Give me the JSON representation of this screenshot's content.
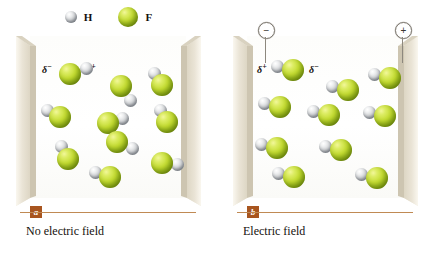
{
  "figure": {
    "legend": {
      "items": [
        {
          "symbol": "H",
          "atom": "hydrogen",
          "color": "#c9cdd1",
          "radius": 6
        },
        {
          "symbol": "F",
          "atom": "fluorine",
          "color": "#c4dc32",
          "radius": 10
        }
      ]
    },
    "colors": {
      "fluorine": "#c4dc32",
      "hydrogen": "#c9cdd1",
      "plate": "#e6e0d2",
      "plate_edge": "#cfc7b4",
      "rule": "#c08a54",
      "badge": "#a8551f",
      "text": "#14100c",
      "background": "#ffffff"
    },
    "panels": [
      {
        "id": "a",
        "badge": "a",
        "caption": "No electric field",
        "field_applied": false,
        "terminals": [],
        "delta_labels": [
          {
            "text": "δ",
            "sign": "−",
            "x": 42,
            "y": 62,
            "target": "fluorine"
          },
          {
            "text": "δ",
            "sign": "+",
            "x": 86,
            "y": 62,
            "target": "hydrogen"
          }
        ],
        "molecules": [
          {
            "fx": 70,
            "fy": 74,
            "hx": 86,
            "hy": 68,
            "angle": -20
          },
          {
            "fx": 121,
            "fy": 86,
            "hx": 130,
            "hy": 100,
            "angle": 58
          },
          {
            "fx": 162,
            "fy": 85,
            "hx": 154,
            "hy": 73,
            "angle": -124
          },
          {
            "fx": 60,
            "fy": 117,
            "hx": 47,
            "hy": 110,
            "angle": 208
          },
          {
            "fx": 108,
            "fy": 123,
            "hx": 122,
            "hy": 118,
            "angle": -20
          },
          {
            "fx": 167,
            "fy": 122,
            "hx": 160,
            "hy": 110,
            "angle": -120
          },
          {
            "fx": 117,
            "fy": 142,
            "hx": 132,
            "hy": 148,
            "angle": 22
          },
          {
            "fx": 68,
            "fy": 159,
            "hx": 61,
            "hy": 146,
            "angle": -118
          },
          {
            "fx": 162,
            "fy": 163,
            "hx": 177,
            "hy": 164,
            "angle": 4
          },
          {
            "fx": 110,
            "fy": 177,
            "hx": 95,
            "hy": 172,
            "angle": 198
          }
        ]
      },
      {
        "id": "b",
        "badge": "b",
        "caption": "Electric field",
        "field_applied": true,
        "terminals": [
          {
            "sign": "−",
            "symbol": "−",
            "side": "left",
            "x": 41,
            "y": 22
          },
          {
            "sign": "+",
            "symbol": "+",
            "side": "right",
            "x": 178,
            "y": 22
          }
        ],
        "delta_labels": [
          {
            "text": "δ",
            "sign": "+",
            "x": 40,
            "y": 62,
            "target": "hydrogen"
          },
          {
            "text": "δ",
            "sign": "−",
            "x": 92,
            "y": 62,
            "target": "fluorine"
          }
        ],
        "molecules": [
          {
            "fx": 76,
            "fy": 70,
            "hx": 60,
            "hy": 66,
            "angle": 180
          },
          {
            "fx": 131,
            "fy": 90,
            "hx": 115,
            "hy": 86,
            "angle": 180
          },
          {
            "fx": 173,
            "fy": 78,
            "hx": 157,
            "hy": 74,
            "angle": 180
          },
          {
            "fx": 63,
            "fy": 107,
            "hx": 47,
            "hy": 103,
            "angle": 180
          },
          {
            "fx": 112,
            "fy": 115,
            "hx": 96,
            "hy": 111,
            "angle": 180
          },
          {
            "fx": 168,
            "fy": 116,
            "hx": 152,
            "hy": 112,
            "angle": 180
          },
          {
            "fx": 60,
            "fy": 148,
            "hx": 44,
            "hy": 144,
            "angle": 180
          },
          {
            "fx": 124,
            "fy": 150,
            "hx": 108,
            "hy": 146,
            "angle": 180
          },
          {
            "fx": 77,
            "fy": 177,
            "hx": 61,
            "hy": 173,
            "angle": 180
          },
          {
            "fx": 160,
            "fy": 178,
            "hx": 144,
            "hy": 174,
            "angle": 180
          }
        ]
      }
    ]
  }
}
